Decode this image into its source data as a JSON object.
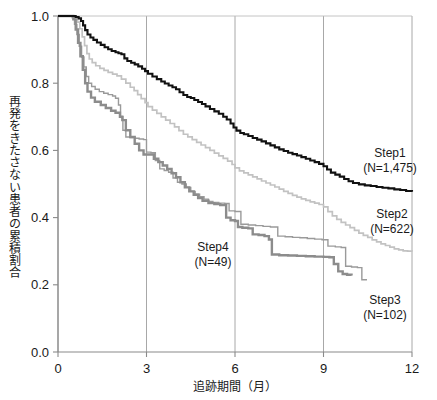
{
  "chart_data": {
    "type": "line",
    "title": "",
    "subtitle": "",
    "xlabel": "追跡期間（月）",
    "ylabel": "再発をきたさない患者の累積割合",
    "ylabel_chars": [
      "再",
      "発",
      "を",
      "き",
      "た",
      "さ",
      "な",
      "い",
      "患",
      "者",
      "の",
      "累",
      "積",
      "割",
      "合"
    ],
    "xlim": [
      0,
      12
    ],
    "ylim": [
      0.0,
      1.0
    ],
    "xticks": [
      0,
      3,
      6,
      9,
      12
    ],
    "xtick_labels": [
      "0",
      "3",
      "6",
      "9",
      "12"
    ],
    "yticks": [
      0.0,
      0.2,
      0.4,
      0.6,
      0.8,
      1.0
    ],
    "ytick_labels": [
      "0.0",
      "0.2",
      "0.4",
      "0.6",
      "0.8",
      "1.0"
    ],
    "grid": "vertical-only",
    "legend_position": "inline-annotations",
    "curve_style": "kaplan-meier-step",
    "series": [
      {
        "name": "Step1",
        "n": "1,475",
        "label_line1": "Step1",
        "label_line2": "(N=1,475)",
        "color": "#111111",
        "width": 2.1,
        "label_x": 390,
        "label_y": 157,
        "points": [
          [
            0.0,
            1.0
          ],
          [
            0.55,
            1.0
          ],
          [
            0.6,
            0.997
          ],
          [
            0.7,
            0.993
          ],
          [
            0.78,
            0.985
          ],
          [
            0.85,
            0.972
          ],
          [
            0.92,
            0.958
          ],
          [
            1.0,
            0.945
          ],
          [
            1.1,
            0.936
          ],
          [
            1.2,
            0.929
          ],
          [
            1.32,
            0.921
          ],
          [
            1.45,
            0.914
          ],
          [
            1.58,
            0.907
          ],
          [
            1.7,
            0.901
          ],
          [
            1.82,
            0.896
          ],
          [
            1.95,
            0.892
          ],
          [
            2.05,
            0.889
          ],
          [
            2.15,
            0.886
          ],
          [
            2.25,
            0.874
          ],
          [
            2.35,
            0.866
          ],
          [
            2.48,
            0.861
          ],
          [
            2.6,
            0.856
          ],
          [
            2.72,
            0.85
          ],
          [
            2.85,
            0.843
          ],
          [
            2.95,
            0.836
          ],
          [
            3.05,
            0.828
          ],
          [
            3.2,
            0.82
          ],
          [
            3.35,
            0.812
          ],
          [
            3.5,
            0.805
          ],
          [
            3.62,
            0.799
          ],
          [
            3.75,
            0.793
          ],
          [
            3.88,
            0.788
          ],
          [
            4.0,
            0.782
          ],
          [
            4.12,
            0.773
          ],
          [
            4.25,
            0.765
          ],
          [
            4.38,
            0.759
          ],
          [
            4.5,
            0.756
          ],
          [
            4.62,
            0.75
          ],
          [
            4.75,
            0.744
          ],
          [
            4.88,
            0.738
          ],
          [
            5.0,
            0.731
          ],
          [
            5.15,
            0.723
          ],
          [
            5.3,
            0.716
          ],
          [
            5.45,
            0.709
          ],
          [
            5.6,
            0.7
          ],
          [
            5.72,
            0.692
          ],
          [
            5.85,
            0.68
          ],
          [
            5.95,
            0.668
          ],
          [
            6.05,
            0.659
          ],
          [
            6.18,
            0.652
          ],
          [
            6.3,
            0.648
          ],
          [
            6.45,
            0.643
          ],
          [
            6.6,
            0.637
          ],
          [
            6.75,
            0.632
          ],
          [
            6.9,
            0.627
          ],
          [
            7.05,
            0.621
          ],
          [
            7.2,
            0.615
          ],
          [
            7.35,
            0.609
          ],
          [
            7.5,
            0.603
          ],
          [
            7.65,
            0.598
          ],
          [
            7.8,
            0.593
          ],
          [
            7.95,
            0.589
          ],
          [
            8.1,
            0.585
          ],
          [
            8.25,
            0.58
          ],
          [
            8.4,
            0.575
          ],
          [
            8.55,
            0.57
          ],
          [
            8.7,
            0.565
          ],
          [
            8.85,
            0.56
          ],
          [
            9.0,
            0.553
          ],
          [
            9.12,
            0.543
          ],
          [
            9.25,
            0.534
          ],
          [
            9.4,
            0.528
          ],
          [
            9.55,
            0.522
          ],
          [
            9.7,
            0.515
          ],
          [
            9.85,
            0.508
          ],
          [
            10.0,
            0.503
          ],
          [
            10.2,
            0.499
          ],
          [
            10.4,
            0.496
          ],
          [
            10.6,
            0.494
          ],
          [
            10.8,
            0.491
          ],
          [
            11.0,
            0.489
          ],
          [
            11.2,
            0.487
          ],
          [
            11.4,
            0.484
          ],
          [
            11.6,
            0.482
          ],
          [
            11.8,
            0.479
          ],
          [
            12.0,
            0.477
          ]
        ]
      },
      {
        "name": "Step2",
        "n": "622",
        "label_line1": "Step2",
        "label_line2": "(N=622)",
        "color": "#c2c2c2",
        "width": 1.7,
        "label_x": 392,
        "label_y": 218,
        "points": [
          [
            0.0,
            1.0
          ],
          [
            0.5,
            1.0
          ],
          [
            0.58,
            0.995
          ],
          [
            0.66,
            0.982
          ],
          [
            0.74,
            0.962
          ],
          [
            0.82,
            0.938
          ],
          [
            0.9,
            0.912
          ],
          [
            0.98,
            0.888
          ],
          [
            1.06,
            0.872
          ],
          [
            1.16,
            0.861
          ],
          [
            1.28,
            0.852
          ],
          [
            1.42,
            0.844
          ],
          [
            1.56,
            0.838
          ],
          [
            1.7,
            0.832
          ],
          [
            1.85,
            0.827
          ],
          [
            2.0,
            0.822
          ],
          [
            2.15,
            0.812
          ],
          [
            2.3,
            0.8
          ],
          [
            2.45,
            0.788
          ],
          [
            2.58,
            0.778
          ],
          [
            2.7,
            0.766
          ],
          [
            2.82,
            0.754
          ],
          [
            2.95,
            0.742
          ],
          [
            3.05,
            0.73
          ],
          [
            3.2,
            0.72
          ],
          [
            3.35,
            0.71
          ],
          [
            3.5,
            0.7
          ],
          [
            3.65,
            0.69
          ],
          [
            3.8,
            0.68
          ],
          [
            3.95,
            0.67
          ],
          [
            4.1,
            0.659
          ],
          [
            4.25,
            0.648
          ],
          [
            4.4,
            0.64
          ],
          [
            4.55,
            0.632
          ],
          [
            4.7,
            0.624
          ],
          [
            4.85,
            0.616
          ],
          [
            5.0,
            0.608
          ],
          [
            5.15,
            0.6
          ],
          [
            5.3,
            0.592
          ],
          [
            5.45,
            0.584
          ],
          [
            5.6,
            0.576
          ],
          [
            5.75,
            0.568
          ],
          [
            5.9,
            0.558
          ],
          [
            6.0,
            0.548
          ],
          [
            6.15,
            0.539
          ],
          [
            6.3,
            0.533
          ],
          [
            6.45,
            0.527
          ],
          [
            6.6,
            0.521
          ],
          [
            6.75,
            0.515
          ],
          [
            6.9,
            0.509
          ],
          [
            7.05,
            0.503
          ],
          [
            7.2,
            0.497
          ],
          [
            7.35,
            0.491
          ],
          [
            7.5,
            0.485
          ],
          [
            7.65,
            0.478
          ],
          [
            7.8,
            0.472
          ],
          [
            7.95,
            0.466
          ],
          [
            8.1,
            0.461
          ],
          [
            8.25,
            0.456
          ],
          [
            8.4,
            0.451
          ],
          [
            8.55,
            0.447
          ],
          [
            8.7,
            0.443
          ],
          [
            8.85,
            0.439
          ],
          [
            9.0,
            0.432
          ],
          [
            9.15,
            0.418
          ],
          [
            9.3,
            0.405
          ],
          [
            9.45,
            0.395
          ],
          [
            9.6,
            0.386
          ],
          [
            9.75,
            0.378
          ],
          [
            9.9,
            0.37
          ],
          [
            10.05,
            0.362
          ],
          [
            10.2,
            0.354
          ],
          [
            10.35,
            0.347
          ],
          [
            10.5,
            0.341
          ],
          [
            10.65,
            0.334
          ],
          [
            10.8,
            0.328
          ],
          [
            10.95,
            0.322
          ],
          [
            11.1,
            0.317
          ],
          [
            11.25,
            0.312
          ],
          [
            11.4,
            0.307
          ],
          [
            11.55,
            0.304
          ],
          [
            11.7,
            0.301
          ],
          [
            11.85,
            0.3
          ],
          [
            12.0,
            0.299
          ]
        ]
      },
      {
        "name": "Step3",
        "n": "102",
        "label_line1": "Step3",
        "label_line2": "(N=102)",
        "color": "#8c8c8c",
        "width": 2.4,
        "label_x": 385,
        "label_y": 304,
        "points": [
          [
            0.0,
            1.0
          ],
          [
            0.45,
            1.0
          ],
          [
            0.52,
            0.99
          ],
          [
            0.6,
            0.96
          ],
          [
            0.68,
            0.92
          ],
          [
            0.76,
            0.88
          ],
          [
            0.84,
            0.84
          ],
          [
            0.92,
            0.8
          ],
          [
            1.0,
            0.775
          ],
          [
            1.12,
            0.757
          ],
          [
            1.25,
            0.745
          ],
          [
            1.45,
            0.735
          ],
          [
            1.62,
            0.726
          ],
          [
            1.8,
            0.718
          ],
          [
            1.95,
            0.712
          ],
          [
            2.1,
            0.7
          ],
          [
            2.18,
            0.69
          ],
          [
            2.3,
            0.66
          ],
          [
            2.45,
            0.64
          ],
          [
            2.6,
            0.62
          ],
          [
            2.75,
            0.6
          ],
          [
            2.9,
            0.588
          ],
          [
            3.1,
            0.588
          ],
          [
            3.25,
            0.575
          ],
          [
            3.4,
            0.565
          ],
          [
            3.55,
            0.555
          ],
          [
            3.7,
            0.545
          ],
          [
            3.85,
            0.532
          ],
          [
            4.0,
            0.52
          ],
          [
            4.15,
            0.505
          ],
          [
            4.3,
            0.49
          ],
          [
            4.45,
            0.478
          ],
          [
            4.6,
            0.468
          ],
          [
            4.75,
            0.458
          ],
          [
            4.9,
            0.45
          ],
          [
            5.1,
            0.443
          ],
          [
            5.3,
            0.44
          ],
          [
            5.5,
            0.437
          ],
          [
            5.7,
            0.4
          ],
          [
            5.85,
            0.392
          ],
          [
            6.0,
            0.39
          ],
          [
            6.1,
            0.372
          ],
          [
            6.25,
            0.37
          ],
          [
            6.45,
            0.368
          ],
          [
            6.6,
            0.35
          ],
          [
            6.8,
            0.348
          ],
          [
            7.0,
            0.345
          ],
          [
            7.15,
            0.335
          ],
          [
            7.25,
            0.29
          ],
          [
            7.5,
            0.288
          ],
          [
            7.8,
            0.287
          ],
          [
            8.1,
            0.286
          ],
          [
            8.4,
            0.285
          ],
          [
            8.7,
            0.284
          ],
          [
            9.0,
            0.283
          ],
          [
            9.2,
            0.282
          ],
          [
            9.35,
            0.262
          ],
          [
            9.5,
            0.24
          ],
          [
            9.65,
            0.232
          ],
          [
            9.8,
            0.23
          ],
          [
            9.95,
            0.228
          ]
        ]
      },
      {
        "name": "Step4",
        "n": "49",
        "label_line1": "Step4",
        "label_line2": "(N=49)",
        "color": "#9a9a9a",
        "width": 1.4,
        "label_x": 213,
        "label_y": 251,
        "points": [
          [
            0.0,
            1.0
          ],
          [
            0.4,
            1.0
          ],
          [
            0.48,
            0.995
          ],
          [
            0.56,
            0.975
          ],
          [
            0.64,
            0.945
          ],
          [
            0.72,
            0.91
          ],
          [
            0.8,
            0.878
          ],
          [
            0.88,
            0.848
          ],
          [
            0.96,
            0.82
          ],
          [
            1.04,
            0.8
          ],
          [
            1.14,
            0.79
          ],
          [
            1.26,
            0.782
          ],
          [
            1.4,
            0.775
          ],
          [
            1.55,
            0.77
          ],
          [
            1.7,
            0.766
          ],
          [
            1.85,
            0.762
          ],
          [
            1.95,
            0.755
          ],
          [
            2.05,
            0.735
          ],
          [
            2.12,
            0.7
          ],
          [
            2.2,
            0.66
          ],
          [
            2.3,
            0.64
          ],
          [
            2.45,
            0.638
          ],
          [
            2.6,
            0.636
          ],
          [
            2.75,
            0.634
          ],
          [
            2.9,
            0.632
          ],
          [
            3.0,
            0.595
          ],
          [
            3.15,
            0.593
          ],
          [
            3.3,
            0.57
          ],
          [
            3.45,
            0.545
          ],
          [
            3.6,
            0.54
          ],
          [
            3.75,
            0.535
          ],
          [
            3.9,
            0.518
          ],
          [
            4.05,
            0.505
          ],
          [
            4.2,
            0.5
          ],
          [
            4.35,
            0.49
          ],
          [
            4.5,
            0.478
          ],
          [
            4.65,
            0.47
          ],
          [
            4.8,
            0.462
          ],
          [
            4.95,
            0.455
          ],
          [
            5.1,
            0.448
          ],
          [
            5.25,
            0.445
          ],
          [
            5.45,
            0.443
          ],
          [
            5.65,
            0.442
          ],
          [
            5.8,
            0.42
          ],
          [
            6.0,
            0.418
          ],
          [
            6.2,
            0.38
          ],
          [
            6.45,
            0.378
          ],
          [
            6.7,
            0.376
          ],
          [
            6.95,
            0.374
          ],
          [
            7.2,
            0.372
          ],
          [
            7.45,
            0.345
          ],
          [
            7.7,
            0.343
          ],
          [
            7.95,
            0.341
          ],
          [
            8.2,
            0.34
          ],
          [
            8.45,
            0.338
          ],
          [
            8.7,
            0.336
          ],
          [
            8.95,
            0.334
          ],
          [
            9.15,
            0.315
          ],
          [
            9.4,
            0.313
          ],
          [
            9.6,
            0.311
          ],
          [
            9.75,
            0.255
          ],
          [
            9.95,
            0.253
          ],
          [
            10.15,
            0.251
          ],
          [
            10.3,
            0.215
          ],
          [
            10.45,
            0.213
          ]
        ]
      }
    ]
  },
  "axes": {
    "x_axis_name": "follow-up-months",
    "y_axis_name": "cumulative-recurrence-free-proportion"
  }
}
